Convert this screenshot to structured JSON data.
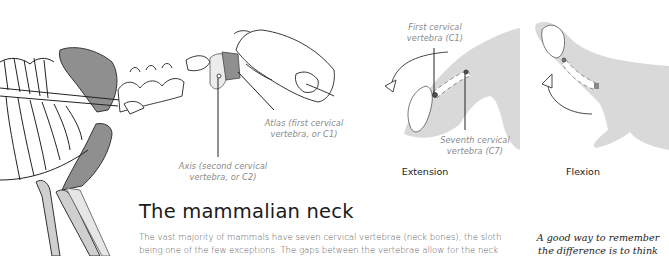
{
  "illustration": {
    "skeleton_labels": {
      "atlas": "Atlas (first cervical vertebra, or C1)",
      "atlas_lines": [
        "Atlas (first cervical",
        "vertebra, or C1)"
      ],
      "axis_lines": [
        "Axis (second cervical",
        "vertebra, or C2)"
      ]
    },
    "extension": {
      "caption": "Extension",
      "c1_lines": [
        "First cervical",
        "vertebra (C1)"
      ],
      "c7_lines": [
        "Seventh cervical",
        "vertebra (C7)"
      ]
    },
    "flexion": {
      "caption": "Flexion"
    },
    "colors": {
      "silhouette": "#d9d9d9",
      "highlight_bone": "#8f8f8f",
      "line": "#1a1a1a",
      "label": "#8a8a8a"
    }
  },
  "article": {
    "title": "The mammalian neck",
    "body_lines": [
      "The vast majority of mammals have seven cervical vertebrae (neck bones), the sloth",
      "being one of the few exceptions. The gaps between the vertebrae allow for the neck"
    ]
  },
  "side_note": {
    "lines": [
      "A good way to remember",
      "the difference is to think"
    ]
  }
}
